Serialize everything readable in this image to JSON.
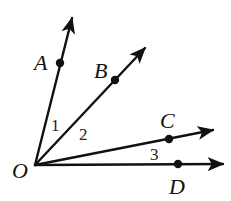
{
  "diagram": {
    "type": "angles-from-common-vertex",
    "vertex": {
      "label": "O",
      "x": 35,
      "y": 165,
      "label_x": 12,
      "label_y": 178
    },
    "rays": [
      {
        "name": "OA",
        "point_label": "A",
        "dot": [
          60,
          63
        ],
        "tip": [
          72,
          18
        ],
        "label_x": 34,
        "label_y": 70
      },
      {
        "name": "OB",
        "point_label": "B",
        "dot": [
          115,
          80
        ],
        "tip": [
          145,
          48
        ],
        "label_x": 94,
        "label_y": 78
      },
      {
        "name": "OC",
        "point_label": "C",
        "dot": [
          169,
          139
        ],
        "tip": [
          213,
          130
        ],
        "label_x": 160,
        "label_y": 128
      },
      {
        "name": "OD",
        "point_label": "D",
        "dot": [
          178,
          164
        ],
        "tip": [
          223,
          164
        ],
        "label_x": 169,
        "label_y": 194
      }
    ],
    "angles": [
      {
        "label": "1",
        "between": "OA-OB",
        "x": 51,
        "y": 131
      },
      {
        "label": "2",
        "between": "OB-OC",
        "x": 79,
        "y": 140
      },
      {
        "label": "3",
        "between": "OC-OD",
        "x": 150,
        "y": 160
      }
    ],
    "colors": {
      "stroke": "#111111",
      "background": "#ffffff"
    }
  }
}
